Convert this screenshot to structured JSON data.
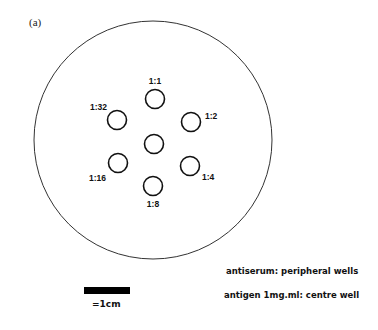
{
  "panel_label": "(a)",
  "plate": {
    "cx": 153,
    "cy": 140,
    "r": 119
  },
  "center_well": {
    "cx": 154,
    "cy": 144,
    "r": 9.5
  },
  "wells": [
    {
      "label": "1:1",
      "cx": 155,
      "cy": 99,
      "lx": 155,
      "ly": 84,
      "anchor": "middle"
    },
    {
      "label": "1:2",
      "cx": 191,
      "cy": 122,
      "lx": 205,
      "ly": 119,
      "anchor": "start"
    },
    {
      "label": "1:4",
      "cx": 190,
      "cy": 166,
      "lx": 202,
      "ly": 180,
      "anchor": "start"
    },
    {
      "label": "1:8",
      "cx": 153,
      "cy": 186,
      "lx": 153,
      "ly": 207,
      "anchor": "middle"
    },
    {
      "label": "1:16",
      "cx": 118,
      "cy": 163,
      "lx": 106,
      "ly": 181,
      "anchor": "end"
    },
    {
      "label": "1:32",
      "cx": 117,
      "cy": 120,
      "lx": 107,
      "ly": 110,
      "anchor": "end"
    }
  ],
  "legend": {
    "line1": "antiserum: peripheral wells",
    "line2": "antigen 1mg.ml: centre well"
  },
  "scale_bar": {
    "label": "=1cm"
  }
}
